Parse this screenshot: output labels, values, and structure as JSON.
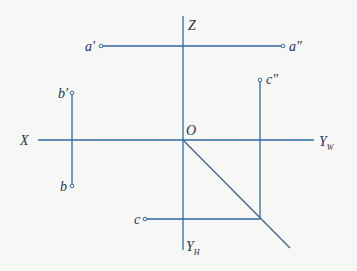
{
  "diagram": {
    "type": "orthographic-projection",
    "colors": {
      "line": "#2f6aa6",
      "diagonal": "#3a5f8a",
      "text": "#2a3350",
      "background": "#f7f7f6"
    },
    "axes": {
      "x": {
        "label": "X"
      },
      "z": {
        "label": "Z"
      },
      "yw": {
        "label": "Y",
        "subscript": "W"
      },
      "yh": {
        "label": "Y",
        "subscript": "H"
      },
      "origin": {
        "label": "O"
      }
    },
    "points": {
      "a_prime": {
        "label": "a′"
      },
      "a_dprime": {
        "label": "a″"
      },
      "b_prime": {
        "label": "b′"
      },
      "b": {
        "label": "b"
      },
      "c_dprime": {
        "label": "c″"
      },
      "c": {
        "label": "c"
      }
    }
  }
}
